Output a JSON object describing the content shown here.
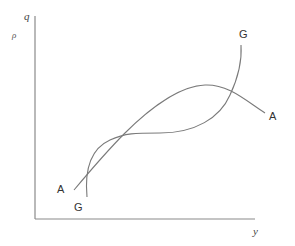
{
  "diagram": {
    "axes": {
      "y_axis_label_top": "q",
      "y_axis_label_secondary": "ρ",
      "x_axis_label": "y"
    },
    "curves": [
      {
        "id": "A",
        "start_label": "A",
        "end_label": "A",
        "color": "#7a7a7a"
      },
      {
        "id": "G",
        "start_label": "G",
        "end_label": "G",
        "color": "#7a7a7a"
      }
    ]
  }
}
